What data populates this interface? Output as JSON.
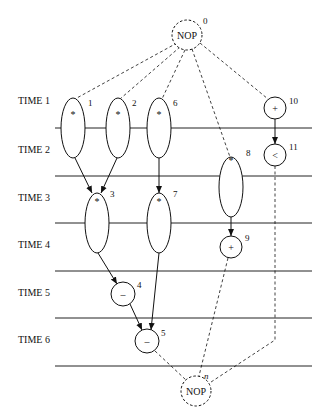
{
  "time_steps": [
    "TIME 1",
    "TIME 2",
    "TIME 3",
    "TIME 4",
    "TIME 5",
    "TIME 6"
  ],
  "nodes": [
    {
      "id": "0",
      "op": "NOP",
      "kind": "nop"
    },
    {
      "id": "1",
      "op": "*",
      "kind": "mult"
    },
    {
      "id": "2",
      "op": "*",
      "kind": "mult"
    },
    {
      "id": "6",
      "op": "*",
      "kind": "mult"
    },
    {
      "id": "10",
      "op": "+",
      "kind": "add"
    },
    {
      "id": "11",
      "op": "<",
      "kind": "cmp"
    },
    {
      "id": "8",
      "op": "*",
      "kind": "mult"
    },
    {
      "id": "3",
      "op": "*",
      "kind": "mult"
    },
    {
      "id": "7",
      "op": "*",
      "kind": "mult"
    },
    {
      "id": "9",
      "op": "+",
      "kind": "add"
    },
    {
      "id": "4",
      "op": "–",
      "kind": "sub"
    },
    {
      "id": "5",
      "op": "–",
      "kind": "sub"
    },
    {
      "id": "n",
      "op": "NOP",
      "kind": "nop"
    }
  ],
  "edges": [
    {
      "from": "0",
      "to": "1",
      "style": "dashed"
    },
    {
      "from": "0",
      "to": "2",
      "style": "dashed"
    },
    {
      "from": "0",
      "to": "6",
      "style": "dashed"
    },
    {
      "from": "0",
      "to": "8",
      "style": "dashed"
    },
    {
      "from": "0",
      "to": "10",
      "style": "dashed"
    },
    {
      "from": "1",
      "to": "3",
      "style": "solid"
    },
    {
      "from": "2",
      "to": "3",
      "style": "solid"
    },
    {
      "from": "6",
      "to": "7",
      "style": "solid"
    },
    {
      "from": "10",
      "to": "11",
      "style": "solid"
    },
    {
      "from": "8",
      "to": "9",
      "style": "solid"
    },
    {
      "from": "3",
      "to": "4",
      "style": "solid"
    },
    {
      "from": "4",
      "to": "5",
      "style": "solid"
    },
    {
      "from": "7",
      "to": "5",
      "style": "solid"
    },
    {
      "from": "5",
      "to": "n",
      "style": "dashed"
    },
    {
      "from": "9",
      "to": "n",
      "style": "dashed"
    },
    {
      "from": "11",
      "to": "n",
      "style": "dashed"
    }
  ]
}
